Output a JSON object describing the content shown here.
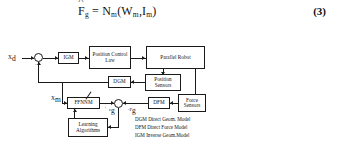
{
  "equation": {
    "number": "(3)",
    "lhs_var": "F",
    "lhs_sub": "g",
    "eq_sign": "=",
    "fn": "N",
    "fn_sub": "m",
    "open": "(",
    "arg1": "W",
    "arg1_sub": "m",
    "comma": ",",
    "arg2": "I",
    "arg2_sub": "m",
    "close": ")",
    "plain": "F̂g = Nm(Wm, Im)"
  },
  "diagram": {
    "blocks": {
      "igm": "IGM",
      "position_control_law": "Position Control\nLaw",
      "position_control_law_line1": "Position Control",
      "position_control_law_line2": "Law",
      "parallel_robot": "Parallel Robot",
      "position_sensors_line1": "Position",
      "position_sensors_line2": "Sensors",
      "dgm": "DGM",
      "ffnnm": "FFNNM",
      "dfm": "DFM",
      "force_sensors_line1": "Force",
      "force_sensors_line2": "Sensors",
      "learning_line1": "Learning",
      "learning_line2": "Algorithms"
    },
    "signals": {
      "xd": "X",
      "xd_sub": "d",
      "xm": "X",
      "xm_sub": "m",
      "minus_feedback": "-",
      "sum_plus": "+",
      "epsilon": "ε",
      "epsilon_sub": "g",
      "fg_hat_minus": "-F",
      "fg_hat_sub": "g"
    },
    "legend": [
      "DGM Direct Geom. Model",
      "DFM Direct Force Model",
      "IGM Inverse Geom.Model"
    ]
  },
  "colors": {
    "ink": "#1a1a1a",
    "background": "#ffffff"
  }
}
